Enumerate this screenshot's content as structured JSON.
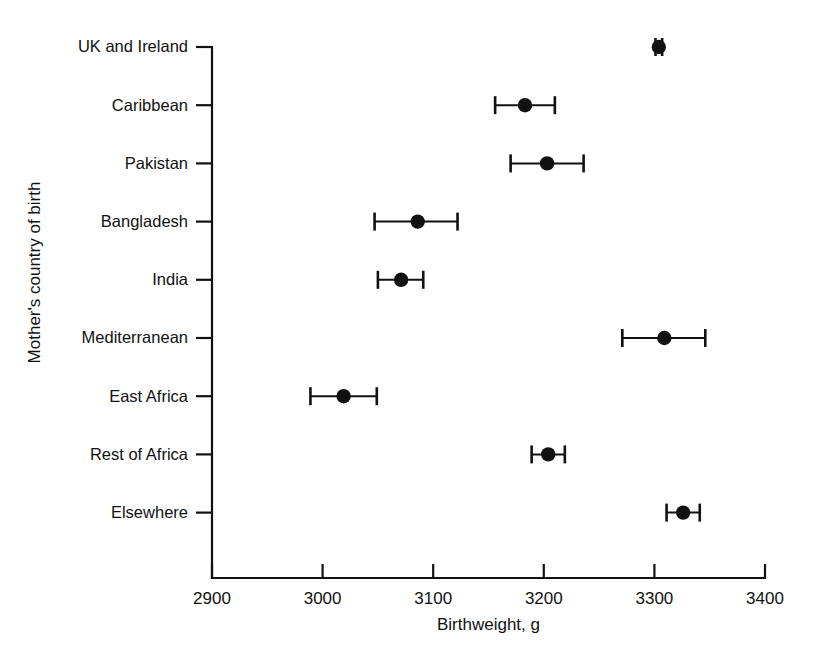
{
  "chart_data": {
    "type": "scatter",
    "title": "",
    "subtitle": "",
    "xlabel": "Birthweight, g",
    "ylabel": "Mother's country of birth",
    "xlim": [
      2900,
      3400
    ],
    "xticks": [
      2900,
      3000,
      3100,
      3200,
      3300,
      3400
    ],
    "xtick_labels": [
      "2900",
      "3000",
      "3100",
      "3200",
      "3300",
      "3400"
    ],
    "grid": false,
    "legend": "none",
    "orientation": "horizontal",
    "error_bar_style": "capped-horizontal-95ci",
    "marker": "filled-circle",
    "marker_color": "#111111",
    "line_color": "#111111",
    "categories": [
      "UK and Ireland",
      "Caribbean",
      "Pakistan",
      "Bangladesh",
      "India",
      "Mediterranean",
      "East Africa",
      "Rest of Africa",
      "Elsewhere"
    ],
    "points": [
      {
        "category": "UK and Ireland",
        "value": 3304,
        "ci_low": 3301,
        "ci_high": 3307
      },
      {
        "category": "Caribbean",
        "value": 3183,
        "ci_low": 3156,
        "ci_high": 3210
      },
      {
        "category": "Pakistan",
        "value": 3203,
        "ci_low": 3170,
        "ci_high": 3236
      },
      {
        "category": "Bangladesh",
        "value": 3086,
        "ci_low": 3047,
        "ci_high": 3122
      },
      {
        "category": "India",
        "value": 3071,
        "ci_low": 3050,
        "ci_high": 3091
      },
      {
        "category": "Mediterranean",
        "value": 3309,
        "ci_low": 3271,
        "ci_high": 3346
      },
      {
        "category": "East Africa",
        "value": 3019,
        "ci_low": 2989,
        "ci_high": 3049
      },
      {
        "category": "Rest of Africa",
        "value": 3204,
        "ci_low": 3189,
        "ci_high": 3219
      },
      {
        "category": "Elsewhere",
        "value": 3326,
        "ci_low": 3311,
        "ci_high": 3341
      }
    ],
    "values": [
      3304,
      3183,
      3203,
      3086,
      3071,
      3309,
      3019,
      3204,
      3326
    ]
  },
  "colors": {
    "foreground": "#111111",
    "background": "#ffffff"
  }
}
